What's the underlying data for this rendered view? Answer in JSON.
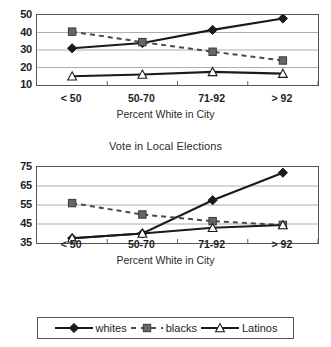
{
  "chart_data": [
    {
      "type": "line",
      "title": "",
      "xlabel": "Percent White in City",
      "ylabel": "",
      "categories": [
        "< 50",
        "50-70",
        "71-92",
        "> 92"
      ],
      "yticks": [
        10,
        20,
        30,
        40,
        50
      ],
      "ylim": [
        10,
        50
      ],
      "grid": true,
      "legend_position": "bottom",
      "series": [
        {
          "name": "whites",
          "values": [
            31,
            34,
            41.5,
            48
          ],
          "marker": "filled-diamond",
          "line": "solid",
          "color": "#1a1a1a"
        },
        {
          "name": "blacks",
          "values": [
            40.5,
            34.5,
            29,
            24
          ],
          "marker": "filled-square",
          "line": "dashed",
          "color": "#666666"
        },
        {
          "name": "Latinos",
          "values": [
            15,
            16,
            17.5,
            16.5
          ],
          "marker": "open-triangle",
          "line": "solid",
          "color": "#1a1a1a"
        }
      ]
    },
    {
      "type": "line",
      "title": "Vote in Local Elections",
      "xlabel": "Percent White in City",
      "ylabel": "",
      "categories": [
        "< 50",
        "50-70",
        "71-92",
        "> 92"
      ],
      "yticks": [
        35,
        45,
        55,
        65,
        75
      ],
      "ylim": [
        35,
        75
      ],
      "grid": true,
      "legend_position": "bottom",
      "series": [
        {
          "name": "whites",
          "values": [
            37.5,
            40,
            57.5,
            72
          ],
          "marker": "filled-diamond",
          "line": "solid",
          "color": "#1a1a1a"
        },
        {
          "name": "blacks",
          "values": [
            56,
            50,
            46.5,
            44.5
          ],
          "marker": "filled-square",
          "line": "dashed",
          "color": "#666666"
        },
        {
          "name": "Latinos",
          "values": [
            37.5,
            40,
            43,
            44.5
          ],
          "marker": "open-triangle",
          "line": "solid",
          "color": "#1a1a1a"
        }
      ]
    }
  ],
  "legend": {
    "entries": [
      {
        "label": "whites",
        "marker": "filled-diamond",
        "line": "solid"
      },
      {
        "label": "blacks",
        "marker": "filled-square",
        "line": "dashed"
      },
      {
        "label": "Latinos",
        "marker": "open-triangle",
        "line": "solid"
      }
    ]
  },
  "colors": {
    "line_dark": "#1a1a1a",
    "marker_gray": "#666666",
    "grid": "#9a9a9a",
    "axis": "#555555",
    "background": "#ffffff"
  }
}
